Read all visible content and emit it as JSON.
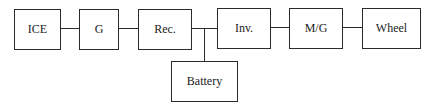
{
  "diagram": {
    "type": "block-diagram",
    "title": "",
    "nodes": [
      {
        "id": "ice",
        "label": "ICE"
      },
      {
        "id": "g",
        "label": "G"
      },
      {
        "id": "rec",
        "label": "Rec."
      },
      {
        "id": "inv",
        "label": "Inv."
      },
      {
        "id": "mg",
        "label": "M/G"
      },
      {
        "id": "wheel",
        "label": "Wheel"
      },
      {
        "id": "battery",
        "label": "Battery"
      }
    ],
    "edges": [
      {
        "from": "ice",
        "to": "g"
      },
      {
        "from": "g",
        "to": "rec"
      },
      {
        "from": "rec",
        "to": "inv"
      },
      {
        "from": "inv",
        "to": "mg"
      },
      {
        "from": "mg",
        "to": "wheel"
      },
      {
        "from": "rec-inv-junction",
        "to": "battery"
      }
    ]
  }
}
